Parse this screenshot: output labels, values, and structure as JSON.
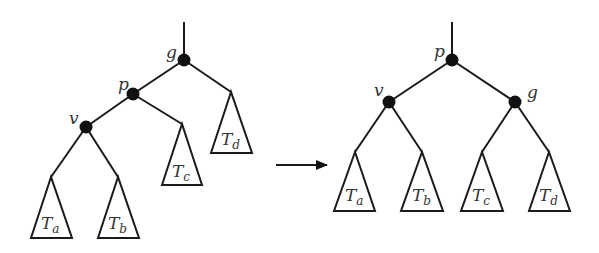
{
  "diagram": {
    "type": "tree-rotation",
    "before": {
      "nodes": [
        {
          "id": "g",
          "label": "g"
        },
        {
          "id": "p",
          "label": "p"
        },
        {
          "id": "v",
          "label": "v"
        }
      ],
      "subtrees": [
        {
          "id": "Ta",
          "base": "T",
          "sub": "a"
        },
        {
          "id": "Tb",
          "base": "T",
          "sub": "b"
        },
        {
          "id": "Tc",
          "base": "T",
          "sub": "c"
        },
        {
          "id": "Td",
          "base": "T",
          "sub": "d"
        }
      ],
      "edges": [
        [
          "g",
          "p"
        ],
        [
          "g",
          "Td"
        ],
        [
          "p",
          "v"
        ],
        [
          "p",
          "Tc"
        ],
        [
          "v",
          "Ta"
        ],
        [
          "v",
          "Tb"
        ]
      ]
    },
    "after": {
      "nodes": [
        {
          "id": "p",
          "label": "p"
        },
        {
          "id": "v",
          "label": "v"
        },
        {
          "id": "g",
          "label": "g"
        }
      ],
      "subtrees": [
        {
          "id": "Ta",
          "base": "T",
          "sub": "a"
        },
        {
          "id": "Tb",
          "base": "T",
          "sub": "b"
        },
        {
          "id": "Tc",
          "base": "T",
          "sub": "c"
        },
        {
          "id": "Td",
          "base": "T",
          "sub": "d"
        }
      ],
      "edges": [
        [
          "p",
          "v"
        ],
        [
          "p",
          "g"
        ],
        [
          "v",
          "Ta"
        ],
        [
          "v",
          "Tb"
        ],
        [
          "g",
          "Tc"
        ],
        [
          "g",
          "Td"
        ]
      ]
    },
    "arrow": "right"
  }
}
